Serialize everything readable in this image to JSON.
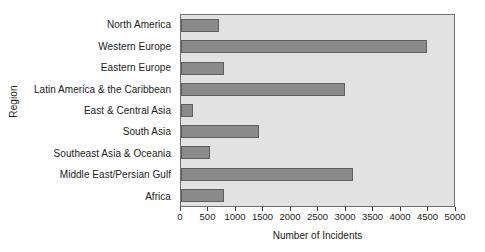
{
  "chart_data": {
    "type": "bar",
    "orientation": "horizontal",
    "title": "",
    "xlabel": "Number of Incidents",
    "ylabel": "Region",
    "categories": [
      "North America",
      "Western Europe",
      "Eastern Europe",
      "Latin America & the Caribbean",
      "East & Central Asia",
      "South Asia",
      "Southeast Asia & Oceania",
      "Middle East/Persian Gulf",
      "Africa"
    ],
    "values": [
      700,
      4500,
      780,
      3000,
      220,
      1420,
      540,
      3150,
      790
    ],
    "xlim": [
      0,
      5000
    ],
    "xticks": [
      0,
      500,
      1000,
      1500,
      2000,
      2500,
      3000,
      3500,
      4000,
      4500,
      5000
    ],
    "xtick_labels": [
      "0",
      "500",
      "1000",
      "1500",
      "2000",
      "2500",
      "3000",
      "3500",
      "4000",
      "4500",
      "5000"
    ],
    "grid": false,
    "legend": "none",
    "colors": {
      "bar_fill": "#8a8a8a",
      "bar_edge": "#5f5f5f",
      "plot_background": "#e2e2e2",
      "plot_border": "#6e6e6e",
      "figure_background": "#ffffff",
      "text": "#1a1a1a"
    }
  }
}
